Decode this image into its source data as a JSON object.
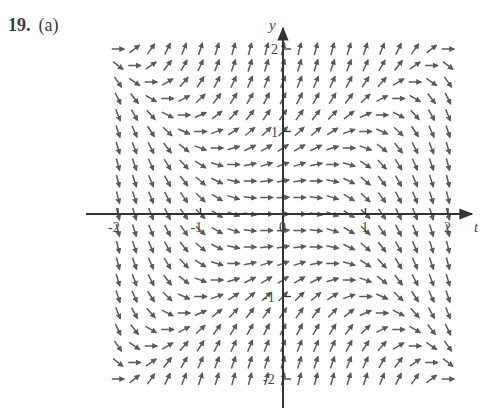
{
  "problem": {
    "number": "19.",
    "part": "(a)"
  },
  "colors": {
    "segment": "#5a5a5a",
    "axis": "#333333",
    "text": "#444444"
  },
  "chart_data": {
    "type": "slope_field",
    "title": "",
    "equation": "dy/dt = y^2 - t^2",
    "xlabel": "t",
    "ylabel": "y",
    "xlim": [
      -2,
      2
    ],
    "ylim": [
      -2,
      2
    ],
    "grid_step": 0.2,
    "x_ticks": [
      {
        "value": -2,
        "label": "-2"
      },
      {
        "value": -1,
        "label": "-1"
      },
      {
        "value": 0,
        "label": "0"
      },
      {
        "value": 1,
        "label": "1"
      },
      {
        "value": 2,
        "label": "2"
      }
    ],
    "y_ticks": [
      {
        "value": -2,
        "label": "-2"
      },
      {
        "value": -1,
        "label": "-1"
      },
      {
        "value": 1,
        "label": "1"
      },
      {
        "value": 2,
        "label": "2"
      }
    ],
    "origin_label": "0",
    "grid": false,
    "legend": null
  },
  "layout": {
    "origin_px": [
      283,
      214
    ],
    "unit_px": 82.5,
    "segment_len_px": 12.5
  }
}
